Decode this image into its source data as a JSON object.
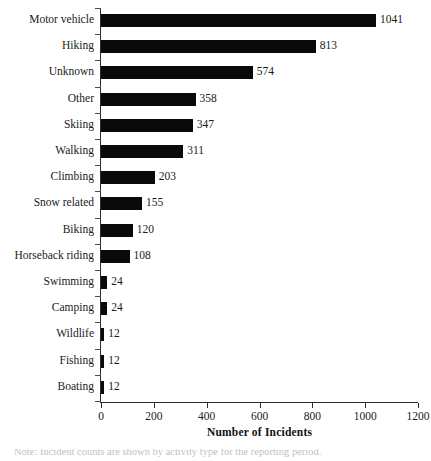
{
  "chart_data": {
    "type": "bar",
    "orientation": "horizontal",
    "title": "",
    "xlabel": "Number of Incidents",
    "ylabel": "",
    "xlim": [
      0,
      1200
    ],
    "xticks": [
      0,
      200,
      400,
      600,
      800,
      1000,
      1200
    ],
    "grid": false,
    "legend": null,
    "bar_color": "#0a0a0a",
    "categories": [
      "Motor vehicle",
      "Hiking",
      "Unknown",
      "Other",
      "Skiing",
      "Walking",
      "Climbing",
      "Snow related",
      "Biking",
      "Horseback riding",
      "Swimming",
      "Camping",
      "Wildlife",
      "Fishing",
      "Boating"
    ],
    "values": [
      1041,
      813,
      574,
      358,
      347,
      311,
      203,
      155,
      120,
      108,
      24,
      24,
      12,
      12,
      12
    ],
    "value_labels": [
      "1041",
      "813",
      "574",
      "358",
      "347",
      "311",
      "203",
      "155",
      "120",
      "108",
      "24",
      "24",
      "12",
      "12",
      "12"
    ]
  },
  "caption": {
    "text": "clipped caption line"
  }
}
